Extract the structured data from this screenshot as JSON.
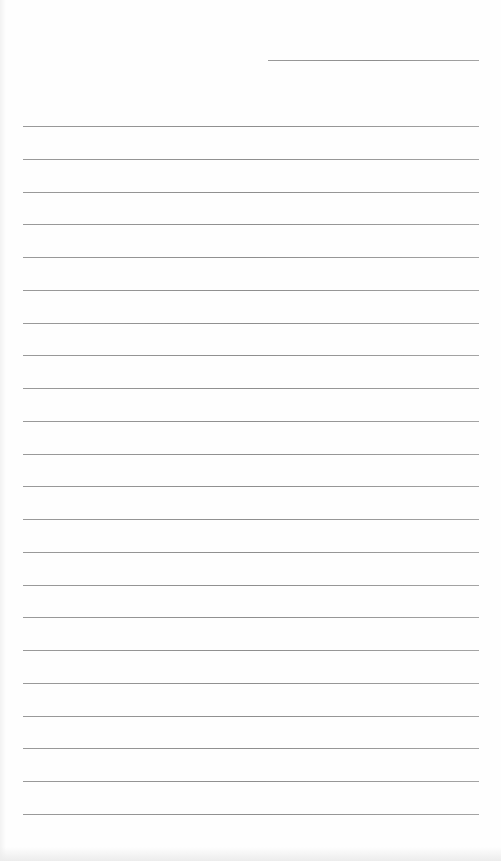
{
  "document": {
    "type": "lined-paper",
    "header_line": {
      "x": 268,
      "y": 60,
      "width": 211
    },
    "ruled_lines": {
      "count": 22,
      "first_y": 126,
      "spacing": 32.75,
      "left": 23,
      "right": 479
    },
    "colors": {
      "paper": "#fefefe",
      "rule": "#999999"
    }
  }
}
